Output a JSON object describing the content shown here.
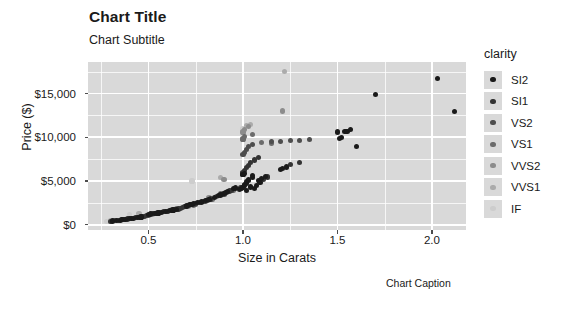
{
  "chart_data": {
    "type": "scatter",
    "title": "Chart Title",
    "subtitle": "Chart Subtitle",
    "caption": "Chart Caption",
    "xlabel": "Size in Carats",
    "ylabel": "Price ($)",
    "xlim": [
      0.18,
      2.18
    ],
    "ylim": [
      -600,
      18600
    ],
    "x_ticks": [
      0.5,
      1.0,
      1.5,
      2.0
    ],
    "x_tick_labels": [
      "0.5",
      "1.0",
      "1.5",
      "2.0"
    ],
    "y_ticks": [
      0,
      5000,
      10000,
      15000
    ],
    "y_tick_labels": [
      "$0",
      "$5,000",
      "$10,000",
      "$15,000"
    ],
    "x_minor_ticks": [
      0.25,
      0.75,
      1.25,
      1.75
    ],
    "y_minor_ticks": [
      2500,
      7500,
      12500,
      17500
    ],
    "grid": true,
    "panel_background": "#d9d9d9",
    "gridline_color": "#ffffff",
    "legend": {
      "title": "clarity",
      "position": "right",
      "entries": [
        {
          "label": "SI2",
          "color": "#1a1a1a"
        },
        {
          "label": "SI1",
          "color": "#333333"
        },
        {
          "label": "VS2",
          "color": "#4d4d4d"
        },
        {
          "label": "VS1",
          "color": "#6b6b6b"
        },
        {
          "label": "VVS2",
          "color": "#8c8c8c"
        },
        {
          "label": "VVS1",
          "color": "#ababab"
        },
        {
          "label": "IF",
          "color": "#cdcdcd"
        }
      ]
    },
    "series": [
      {
        "name": "SI2",
        "color": "#1a1a1a",
        "points": [
          [
            0.31,
            420
          ],
          [
            0.33,
            480
          ],
          [
            0.35,
            520
          ],
          [
            0.36,
            560
          ],
          [
            0.38,
            610
          ],
          [
            0.4,
            700
          ],
          [
            0.41,
            720
          ],
          [
            0.42,
            760
          ],
          [
            0.44,
            820
          ],
          [
            0.46,
            880
          ],
          [
            0.5,
            1180
          ],
          [
            0.51,
            1220
          ],
          [
            0.53,
            1280
          ],
          [
            0.55,
            1350
          ],
          [
            0.57,
            1420
          ],
          [
            0.59,
            1500
          ],
          [
            0.61,
            1600
          ],
          [
            0.63,
            1680
          ],
          [
            0.65,
            1760
          ],
          [
            0.7,
            2150
          ],
          [
            0.71,
            2200
          ],
          [
            0.72,
            2280
          ],
          [
            0.73,
            2320
          ],
          [
            0.74,
            2400
          ],
          [
            0.76,
            2500
          ],
          [
            0.78,
            2600
          ],
          [
            0.8,
            2750
          ],
          [
            0.82,
            2850
          ],
          [
            0.9,
            3600
          ],
          [
            0.91,
            3700
          ],
          [
            0.92,
            3780
          ],
          [
            0.95,
            4100
          ],
          [
            1.0,
            4300
          ],
          [
            1.01,
            4450
          ],
          [
            1.01,
            4600
          ],
          [
            1.02,
            4750
          ],
          [
            1.02,
            4900
          ],
          [
            1.03,
            5050
          ],
          [
            1.03,
            5200
          ],
          [
            1.04,
            4400
          ],
          [
            1.04,
            4250
          ],
          [
            1.05,
            5400
          ],
          [
            1.05,
            5600
          ],
          [
            1.06,
            4150
          ],
          [
            1.07,
            4500
          ],
          [
            1.08,
            5100
          ],
          [
            1.09,
            4800
          ],
          [
            1.1,
            5300
          ],
          [
            1.12,
            5500
          ],
          [
            1.2,
            6300
          ],
          [
            1.21,
            6400
          ],
          [
            1.23,
            6600
          ],
          [
            1.5,
            10600
          ],
          [
            1.51,
            9900
          ],
          [
            1.52,
            9950
          ],
          [
            1.54,
            10650
          ],
          [
            1.55,
            10700
          ],
          [
            1.57,
            10900
          ],
          [
            1.6,
            8900
          ],
          [
            1.7,
            14900
          ],
          [
            2.03,
            16700
          ],
          [
            2.12,
            12900
          ],
          [
            0.96,
            4200
          ],
          [
            0.98,
            4050
          ],
          [
            1.0,
            5700
          ],
          [
            1.01,
            5900
          ],
          [
            1.02,
            3900
          ],
          [
            0.85,
            3100
          ],
          [
            0.87,
            3300
          ],
          [
            0.88,
            3400
          ]
        ]
      },
      {
        "name": "SI1",
        "color": "#333333",
        "points": [
          [
            0.3,
            400
          ],
          [
            0.34,
            500
          ],
          [
            0.37,
            580
          ],
          [
            0.39,
            660
          ],
          [
            0.43,
            790
          ],
          [
            0.47,
            900
          ],
          [
            0.52,
            1250
          ],
          [
            0.54,
            1320
          ],
          [
            0.56,
            1400
          ],
          [
            0.58,
            1470
          ],
          [
            0.6,
            1560
          ],
          [
            0.62,
            1640
          ],
          [
            0.64,
            1720
          ],
          [
            0.66,
            1800
          ],
          [
            0.69,
            2100
          ],
          [
            0.75,
            2450
          ],
          [
            0.77,
            2550
          ],
          [
            0.79,
            2680
          ],
          [
            0.81,
            2800
          ],
          [
            0.83,
            2950
          ],
          [
            0.89,
            3500
          ],
          [
            0.93,
            3850
          ],
          [
            0.94,
            3950
          ],
          [
            0.99,
            4200
          ],
          [
            1.0,
            6000
          ],
          [
            1.0,
            5800
          ],
          [
            1.01,
            6200
          ],
          [
            1.02,
            6500
          ],
          [
            1.03,
            6800
          ],
          [
            1.04,
            7100
          ],
          [
            1.06,
            7400
          ],
          [
            1.08,
            7700
          ],
          [
            1.11,
            5150
          ],
          [
            1.13,
            5450
          ],
          [
            1.25,
            6900
          ],
          [
            1.3,
            7100
          ],
          [
            0.68,
            1950
          ],
          [
            0.67,
            1880
          ],
          [
            0.48,
            950
          ],
          [
            0.49,
            1050
          ]
        ]
      },
      {
        "name": "VS2",
        "color": "#4d4d4d",
        "points": [
          [
            0.32,
            450
          ],
          [
            0.45,
            850
          ],
          [
            0.5,
            1100
          ],
          [
            0.6,
            1520
          ],
          [
            0.7,
            2050
          ],
          [
            0.8,
            2700
          ],
          [
            0.9,
            3450
          ],
          [
            1.0,
            8000
          ],
          [
            1.01,
            8300
          ],
          [
            1.02,
            8600
          ],
          [
            1.03,
            8900
          ],
          [
            1.05,
            9200
          ],
          [
            1.15,
            9500
          ],
          [
            1.2,
            9550
          ],
          [
            1.25,
            9600
          ],
          [
            1.3,
            9650
          ],
          [
            1.35,
            9700
          ],
          [
            0.86,
            3200
          ],
          [
            0.75,
            2350
          ]
        ]
      },
      {
        "name": "VS1",
        "color": "#6b6b6b",
        "points": [
          [
            0.41,
            740
          ],
          [
            0.55,
            1300
          ],
          [
            0.65,
            1850
          ],
          [
            0.74,
            2250
          ],
          [
            0.84,
            2900
          ],
          [
            1.0,
            9800
          ],
          [
            1.01,
            10100
          ],
          [
            1.05,
            10300
          ],
          [
            1.1,
            9400
          ],
          [
            1.15,
            9300
          ],
          [
            0.95,
            3950
          ],
          [
            0.88,
            3550
          ]
        ]
      },
      {
        "name": "VVS2",
        "color": "#8c8c8c",
        "points": [
          [
            0.36,
            600
          ],
          [
            0.52,
            1200
          ],
          [
            0.71,
            2100
          ],
          [
            0.9,
            5200
          ],
          [
            1.0,
            10600
          ],
          [
            1.01,
            10900
          ],
          [
            1.03,
            11200
          ],
          [
            1.21,
            13000
          ],
          [
            0.82,
            3050
          ]
        ]
      },
      {
        "name": "VVS1",
        "color": "#ababab",
        "points": [
          [
            0.3,
            430
          ],
          [
            0.45,
            1250
          ],
          [
            0.62,
            1700
          ],
          [
            0.88,
            5400
          ],
          [
            1.02,
            11300
          ],
          [
            1.22,
            17500
          ],
          [
            1.04,
            11500
          ]
        ]
      },
      {
        "name": "IF",
        "color": "#cdcdcd",
        "points": [
          [
            0.28,
            380
          ],
          [
            0.4,
            1150
          ],
          [
            0.73,
            5000
          ],
          [
            1.0,
            11000
          ]
        ]
      }
    ]
  }
}
